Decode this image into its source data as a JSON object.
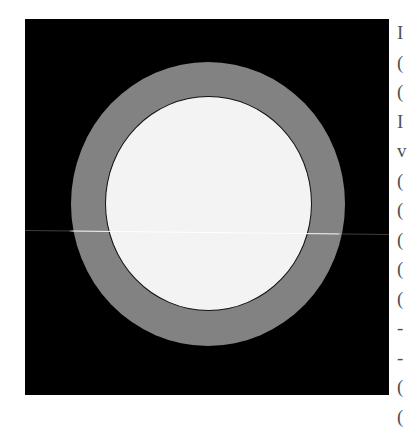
{
  "figure": {
    "colors": {
      "background": "#000000",
      "ring": "#828282",
      "disk": "#f3f3f3",
      "disk_outline": "#111111",
      "scan_line": "#ffffff"
    },
    "geometry": {
      "frame": {
        "x": 25,
        "y": 19,
        "width": 364,
        "height": 376
      },
      "center": {
        "x": 208,
        "y": 204
      },
      "outer_radius": 137,
      "inner_radius": 104
    }
  },
  "margin_text": {
    "clipped_glyphs": [
      "I",
      "(",
      "(",
      "I",
      "v",
      "(",
      "(",
      "(",
      "(",
      "(",
      "-",
      "-",
      "(",
      "("
    ]
  }
}
